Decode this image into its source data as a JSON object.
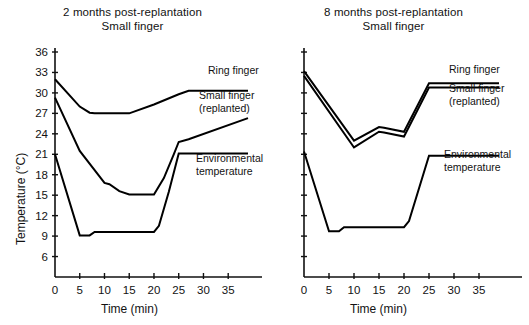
{
  "figure": {
    "ylabel": "Temperature (°C)",
    "xlabel": "Time (min)"
  },
  "chart_data": [
    {
      "type": "line",
      "panel": "left",
      "title": "2 months post-replantation",
      "subtitle": "Small finger",
      "xlabel": "Time (min)",
      "ylabel": "Temperature (°C)",
      "xlim": [
        0,
        39
      ],
      "ylim": [
        3,
        36
      ],
      "xticks": [
        0,
        5,
        10,
        15,
        20,
        25,
        30,
        35
      ],
      "yticks": [
        6,
        9,
        12,
        15,
        18,
        21,
        24,
        27,
        30,
        33,
        36
      ],
      "grid": false,
      "legend_position": "inline-right",
      "series": [
        {
          "name": "Ring finger",
          "x": [
            0,
            5,
            7,
            8,
            15,
            20,
            25,
            27,
            39
          ],
          "values": [
            32.0,
            28.0,
            27.1,
            27.0,
            27.0,
            28.3,
            29.8,
            30.3,
            30.3
          ]
        },
        {
          "name": "Small finger (replanted)",
          "x": [
            0,
            5,
            10,
            11,
            13,
            15,
            20,
            22,
            24,
            25,
            27,
            39
          ],
          "values": [
            29.3,
            21.5,
            16.8,
            16.6,
            15.6,
            15.1,
            15.1,
            17.5,
            21.0,
            22.8,
            23.2,
            26.3
          ]
        },
        {
          "name": "Environmental temperature",
          "x": [
            0,
            5,
            7,
            8,
            20,
            21,
            23,
            25,
            39
          ],
          "values": [
            21.0,
            9.1,
            9.1,
            9.6,
            9.6,
            10.5,
            15.5,
            21.1,
            21.1
          ]
        }
      ]
    },
    {
      "type": "line",
      "panel": "right",
      "title": "8 months post-replantation",
      "subtitle": "Small finger",
      "xlabel": "Time (min)",
      "ylabel": "Temperature (°C)",
      "xlim": [
        0,
        39
      ],
      "ylim": [
        3,
        36
      ],
      "xticks": [
        0,
        5,
        10,
        15,
        20,
        25,
        30,
        35
      ],
      "yticks": [
        6,
        9,
        12,
        15,
        18,
        21,
        24,
        27,
        30,
        33,
        36
      ],
      "grid": false,
      "legend_position": "inline-right",
      "series": [
        {
          "name": "Ring finger",
          "x": [
            0,
            10,
            15,
            16,
            20,
            25,
            39
          ],
          "values": [
            33.2,
            23.0,
            25.0,
            24.9,
            24.3,
            31.4,
            31.4
          ]
        },
        {
          "name": "Small finger (replanted)",
          "x": [
            0,
            10,
            15,
            16,
            20,
            25,
            39
          ],
          "values": [
            32.5,
            22.0,
            24.3,
            24.2,
            23.6,
            30.8,
            30.8
          ]
        },
        {
          "name": "Environmental temperature",
          "x": [
            0,
            5,
            7,
            8,
            20,
            21,
            25,
            39
          ],
          "values": [
            21.4,
            9.7,
            9.7,
            10.3,
            10.3,
            11.2,
            20.8,
            20.8
          ]
        }
      ]
    }
  ],
  "panels": {
    "left": {
      "title_line1": "2 months post-replantation",
      "title_line2": "Small finger",
      "axis": {
        "ylabel": "Temperature (°C)",
        "xlabel": "Time (min)",
        "yticks": [
          "36",
          "33",
          "30",
          "27",
          "24",
          "21",
          "18",
          "15",
          "12",
          "9",
          "6"
        ],
        "xticks": [
          "0",
          "5",
          "10",
          "15",
          "20",
          "25",
          "30",
          "35"
        ]
      },
      "labels": {
        "ring": "Ring finger",
        "small_l1": "Small finger",
        "small_l2": "(replanted)",
        "env_l1": "Environmental",
        "env_l2": "temperature"
      }
    },
    "right": {
      "title_line1": "8 months post-replantation",
      "title_line2": "Small finger",
      "axis": {
        "xlabel": "Time (min)",
        "xticks": [
          "0",
          "5",
          "10",
          "15",
          "20",
          "25",
          "30",
          "35"
        ]
      },
      "labels": {
        "ring": "Ring finger",
        "small_l1": "Small finger",
        "small_l2": "(replanted)",
        "env_l1": "Environmental",
        "env_l2": "temperature"
      }
    }
  },
  "colors": {
    "ink": "#000000",
    "background": "#ffffff"
  }
}
